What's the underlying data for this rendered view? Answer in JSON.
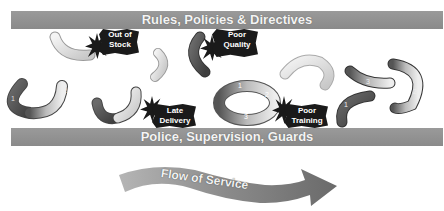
{
  "diagram": {
    "top_bar": {
      "label": "Rules, Policies & Directives"
    },
    "bottom_bar": {
      "label": "Police, Supervision, Guards"
    },
    "problems": [
      {
        "line1": "Out of",
        "line2": "Stock"
      },
      {
        "line1": "Poor",
        "line2": "Quality"
      },
      {
        "line1": "Late",
        "line2": "Delivery"
      },
      {
        "line1": "Poor",
        "line2": "Training"
      }
    ],
    "pipe_numbers": {
      "left_pipe": [
        "1",
        "2",
        "3"
      ],
      "ring": [
        "1",
        "2",
        "3"
      ],
      "right_pipes": [
        "1",
        "2",
        "3"
      ]
    },
    "flow_arrow": {
      "label": "Flow of Service"
    },
    "colors": {
      "bar": "#8f8f8f",
      "burst": "#1a1a1a",
      "pipe_dark": "#5a5a5a",
      "pipe_light": "#e0e0e0",
      "arrow": "#7d7d7d"
    }
  }
}
